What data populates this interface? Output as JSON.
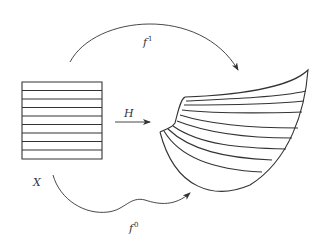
{
  "diagram": {
    "labels": {
      "domain": "X",
      "map_top": {
        "base": "f",
        "sup": "1"
      },
      "map_bottom": {
        "base": "f",
        "sup": "0"
      },
      "homotopy": "H"
    },
    "source_strips": 9,
    "colors": {
      "stroke": "#333333",
      "background": "#ffffff"
    }
  }
}
